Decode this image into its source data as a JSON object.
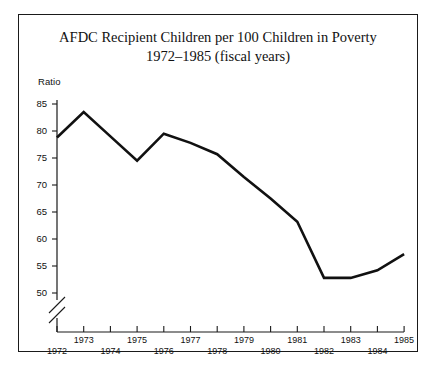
{
  "figure": {
    "background_color": "#ffffff",
    "border_color": "#1a1a1a",
    "line_color": "#111111"
  },
  "title": {
    "line1": "AFDC Recipient Children per 100 Children in Poverty",
    "line2": "1972–1985 (fiscal years)"
  },
  "axis": {
    "y_name": "Ratio",
    "y_ticks": [
      "85",
      "80",
      "75",
      "70",
      "65",
      "60",
      "55",
      "50"
    ],
    "x_ticks_upper": [
      "1973",
      "1975",
      "1977",
      "1979",
      "1981",
      "1983",
      "1985"
    ],
    "x_ticks_lower": [
      "1972",
      "1974",
      "1976",
      "1978",
      "1980",
      "1982",
      "1984"
    ]
  },
  "chart_data": {
    "type": "line",
    "title": "AFDC Recipient Children per 100 Children in Poverty 1972–1985 (fiscal years)",
    "xlabel": "",
    "ylabel": "Ratio",
    "ylim": [
      48,
      86
    ],
    "xlim": [
      1972,
      1985
    ],
    "grid": false,
    "legend": false,
    "axis_break": true,
    "axis_break_note": "y-axis broken below 50",
    "x": [
      1972,
      1973,
      1974,
      1975,
      1976,
      1977,
      1978,
      1979,
      1980,
      1981,
      1982,
      1983,
      1984,
      1985
    ],
    "values": [
      78.8,
      83.5,
      79.0,
      74.5,
      79.5,
      77.8,
      75.7,
      71.5,
      67.5,
      63.2,
      52.8,
      52.8,
      54.2,
      57.2
    ],
    "series": [
      {
        "name": "AFDC recipient children per 100 children in poverty",
        "values": [
          78.8,
          83.5,
          79.0,
          74.5,
          79.5,
          77.8,
          75.7,
          71.5,
          67.5,
          63.2,
          52.8,
          52.8,
          54.2,
          57.2
        ]
      }
    ]
  }
}
